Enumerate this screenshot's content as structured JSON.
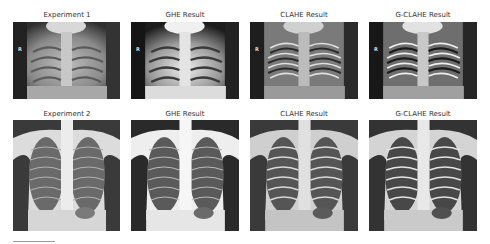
{
  "figure": {
    "rows": [
      {
        "row_label": "Experiment 1",
        "panels": [
          {
            "title": "Experiment 1",
            "variant": "original",
            "marker": "R"
          },
          {
            "title": "GHE Result",
            "variant": "ghe",
            "marker": "R"
          },
          {
            "title": "CLAHE Result",
            "variant": "clahe",
            "marker": "R"
          },
          {
            "title": "G-CLAHE Result",
            "variant": "gclahe",
            "marker": "R"
          }
        ]
      },
      {
        "row_label": "Experiment 2",
        "panels": [
          {
            "title": "Experiment 2",
            "variant": "original"
          },
          {
            "title": "GHE Result",
            "variant": "ghe"
          },
          {
            "title": "CLAHE Result",
            "variant": "clahe"
          },
          {
            "title": "G-CLAHE Result",
            "variant": "gclahe"
          }
        ]
      }
    ]
  },
  "images": {
    "description": "Chest X-ray radiographs comparing original image with GHE, CLAHE and G-CLAHE contrast enhancement results"
  }
}
